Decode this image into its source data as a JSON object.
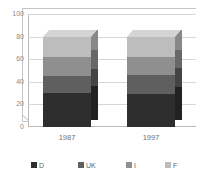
{
  "chart_data": {
    "type": "bar",
    "subtype": "stacked-column-3d",
    "title": "",
    "xlabel": "",
    "ylabel": "",
    "categories": [
      "1987",
      "1997"
    ],
    "series": [
      {
        "name": "D",
        "values": [
          30,
          29
        ],
        "color": "#2e2e2e"
      },
      {
        "name": "UK",
        "values": [
          15,
          17
        ],
        "color": "#5f5f5f"
      },
      {
        "name": "I",
        "values": [
          17,
          16
        ],
        "color": "#8f8f8f"
      },
      {
        "name": "F",
        "values": [
          18,
          18
        ],
        "color": "#bdbdbd"
      }
    ],
    "totals": [
      80,
      80
    ],
    "ylim": [
      0,
      100
    ],
    "yticks": [
      0,
      20,
      40,
      60,
      80,
      100
    ],
    "ytick_labels": [
      "0",
      "20",
      "40",
      "60",
      "80",
      "100"
    ],
    "grid": true,
    "legend_position": "bottom"
  },
  "axis": {
    "y": {
      "ticks": [
        {
          "label": "100",
          "value": 100
        },
        {
          "label": "80",
          "value": 80
        },
        {
          "label": "60",
          "value": 60
        },
        {
          "label": "40",
          "value": 40
        },
        {
          "label": "20",
          "value": 20
        },
        {
          "label": "0",
          "value": 0
        }
      ]
    },
    "x": {
      "ticks": [
        {
          "label": "1987"
        },
        {
          "label": "1997"
        }
      ]
    }
  },
  "legend": {
    "items": [
      {
        "label": "D",
        "color": "#2e2e2e"
      },
      {
        "label": "UK",
        "color": "#5f5f5f"
      },
      {
        "label": "I",
        "color": "#8f8f8f"
      },
      {
        "label": "F",
        "color": "#bdbdbd"
      }
    ]
  },
  "colors": {
    "background": "#ffffff",
    "gridline": "#d7d7d7",
    "axis": "#b9b9b9",
    "depth": "#c6c6c6",
    "tick_text": "#8a8a8a",
    "category_text": "#6f6f6f",
    "legend_text": "#5d5d5d"
  }
}
